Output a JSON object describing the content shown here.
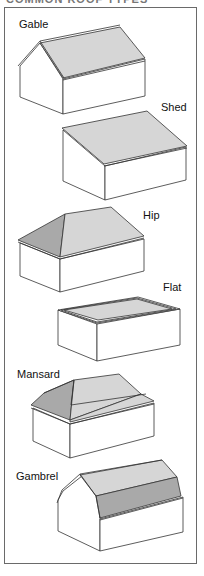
{
  "title": "COMMON ROOF TYPES",
  "colors": {
    "outline": "#333333",
    "roof_light": "#d6d6d6",
    "roof_dark": "#a9a9a9",
    "wall": "#ffffff",
    "frame": "#6a6a6a"
  },
  "roof_types": [
    {
      "label": "Gable"
    },
    {
      "label": "Shed"
    },
    {
      "label": "Hip"
    },
    {
      "label": "Flat"
    },
    {
      "label": "Mansard"
    },
    {
      "label": "Gambrel"
    }
  ]
}
